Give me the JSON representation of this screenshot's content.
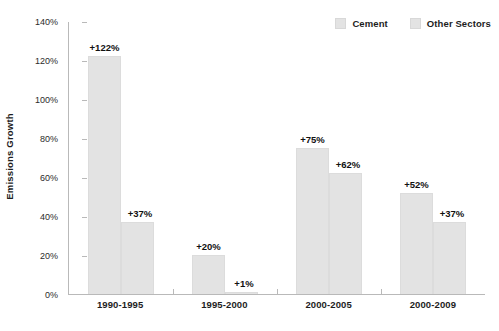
{
  "chart_data": {
    "type": "bar",
    "title": "",
    "subtitle": "",
    "xlabel": "",
    "ylabel": "Emissions Growth",
    "categories": [
      "1990-1995",
      "1995-2000",
      "2000-2005",
      "2000-2009"
    ],
    "series": [
      {
        "name": "Cement",
        "color": "#e3e3e3",
        "values": [
          122,
          20,
          75,
          52
        ],
        "labels": [
          "+122%",
          "+20%",
          "+75%",
          "+52%"
        ]
      },
      {
        "name": "Other Sectors",
        "color": "#e3e3e3",
        "values": [
          37,
          1,
          62,
          37
        ],
        "labels": [
          "+37%",
          "+1%",
          "+62%",
          "+37%"
        ]
      }
    ],
    "ylim": [
      0,
      140
    ],
    "ytick_values": [
      0,
      20,
      40,
      60,
      80,
      100,
      120,
      140
    ],
    "ytick_labels": [
      "0%",
      "20%",
      "40%",
      "60%",
      "80%",
      "100%",
      "120%",
      "140%"
    ],
    "grid": false,
    "legend_position": "top-right",
    "axis_color": "#b9b9b9"
  }
}
